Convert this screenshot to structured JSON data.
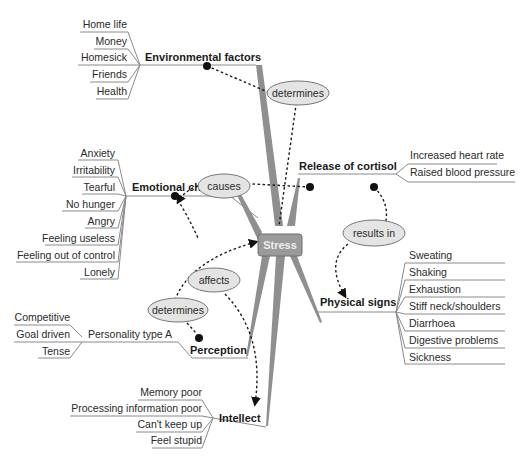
{
  "center": {
    "label": "Stress",
    "fill": "#9a9a9a"
  },
  "branches": {
    "environmental": {
      "label": "Environmental factors",
      "items": [
        "Home life",
        "Money",
        "Homesick",
        "Friends",
        "Health"
      ]
    },
    "emotional": {
      "label": "Emotional changes",
      "items": [
        "Anxiety",
        "Irritability",
        "Tearful",
        "No hunger",
        "Angry",
        "Feeling useless",
        "Feeling out of control",
        "Lonely"
      ]
    },
    "cortisol": {
      "label": "Release of cortisol",
      "items": [
        "Increased heart rate",
        "Raised blood pressure"
      ]
    },
    "physical": {
      "label": "Physical signs",
      "items": [
        "Sweating",
        "Shaking",
        "Exhaustion",
        "Stiff neck/shoulders",
        "Diarrhoea",
        "Digestive problems",
        "Sickness"
      ]
    },
    "perception": {
      "label": "Perception",
      "sub": {
        "label": "Personality type A",
        "items": [
          "Competitive",
          "Goal driven",
          "Tense"
        ]
      }
    },
    "intellect": {
      "label": "Intellect",
      "items": [
        "Memory poor",
        "Processing information poor",
        "Can't keep up",
        "Feel stupid"
      ]
    }
  },
  "relations": {
    "determines_top": "determines",
    "causes": "causes",
    "results_in": "results in",
    "affects": "affects",
    "determines_bottom": "determines"
  }
}
